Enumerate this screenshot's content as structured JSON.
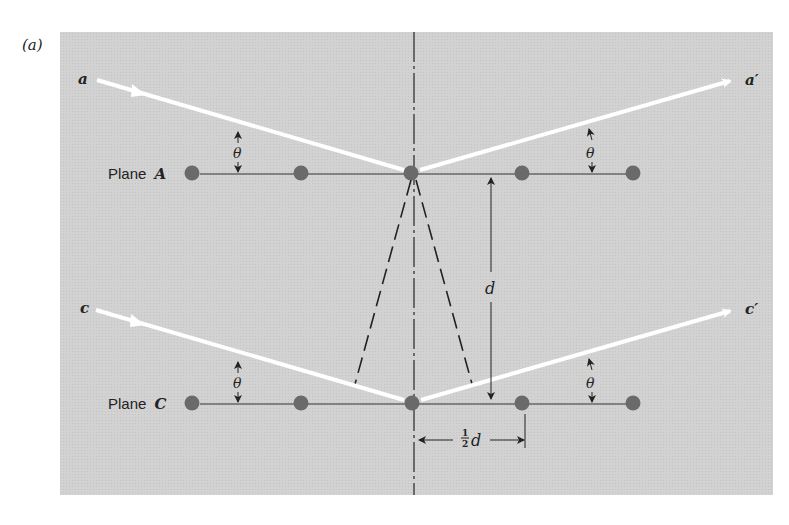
{
  "figure": {
    "panel_label": "(a)",
    "background_color": "#d4d4d4",
    "ray_color": "#ffffff",
    "atom_color": "#6a6a6a",
    "line_color": "#333333"
  },
  "planes": [
    {
      "name": "Plane A",
      "prefix": "Plane",
      "letter": "A",
      "y": 173,
      "atoms_x": [
        192,
        301,
        411,
        522,
        633
      ]
    },
    {
      "name": "Plane C",
      "prefix": "Plane",
      "letter": "C",
      "y": 403,
      "atoms_x": [
        192,
        301,
        411,
        522,
        633
      ]
    }
  ],
  "rays": {
    "incident_top": {
      "label": "a"
    },
    "reflected_top": {
      "label": "a′"
    },
    "incident_bottom": {
      "label": "c"
    },
    "reflected_bottom": {
      "label": "c′"
    }
  },
  "angles": {
    "symbol": "θ",
    "markers": [
      {
        "plane": "A",
        "side": "left"
      },
      {
        "plane": "A",
        "side": "right"
      },
      {
        "plane": "C",
        "side": "left"
      },
      {
        "plane": "C",
        "side": "right"
      }
    ]
  },
  "dimensions": {
    "spacing": {
      "label": "d"
    },
    "half_spacing": {
      "numerator": "1",
      "denominator": "2",
      "variable": "d",
      "label": "½d"
    }
  }
}
